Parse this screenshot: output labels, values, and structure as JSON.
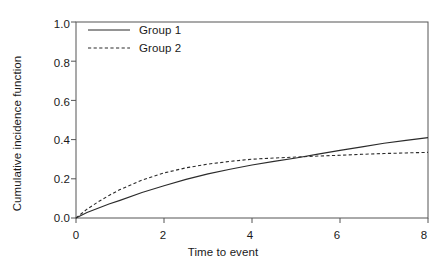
{
  "chart_data": {
    "type": "line",
    "title": "",
    "xlabel": "Time to event",
    "ylabel": "Cumulative incidence function",
    "xlim": [
      0,
      8
    ],
    "ylim": [
      0,
      1.0
    ],
    "xticks": [
      "0",
      "2",
      "4",
      "6",
      "8"
    ],
    "xtick_values": [
      0,
      2,
      4,
      6,
      8
    ],
    "yticks": [
      "0.0",
      "0.2",
      "0.4",
      "0.6",
      "0.8",
      "1.0"
    ],
    "ytick_values": [
      0.0,
      0.2,
      0.4,
      0.6,
      0.8,
      1.0
    ],
    "grid": false,
    "legend_position": "top-left",
    "line_color": "#2b2b2b",
    "axis_color": "#555555",
    "background": "#ffffff",
    "x": [
      0,
      0.25,
      0.5,
      0.75,
      1,
      1.5,
      2,
      2.5,
      3,
      3.5,
      4,
      4.5,
      5,
      5.5,
      6,
      6.5,
      7,
      7.5,
      8
    ],
    "series": [
      {
        "name": "Group 1",
        "style": "solid",
        "values": [
          0.0,
          0.028,
          0.05,
          0.071,
          0.09,
          0.13,
          0.165,
          0.197,
          0.225,
          0.249,
          0.27,
          0.289,
          0.306,
          0.326,
          0.345,
          0.363,
          0.381,
          0.396,
          0.41
        ]
      },
      {
        "name": "Group 2",
        "style": "dashed",
        "values": [
          0.0,
          0.045,
          0.082,
          0.115,
          0.145,
          0.193,
          0.23,
          0.256,
          0.275,
          0.289,
          0.3,
          0.306,
          0.311,
          0.316,
          0.32,
          0.325,
          0.329,
          0.332,
          0.335
        ]
      }
    ],
    "crossover_x": 5.1,
    "crossover_y": 0.311
  },
  "legend": {
    "entries": [
      {
        "label": "Group 1"
      },
      {
        "label": "Group 2"
      }
    ]
  }
}
